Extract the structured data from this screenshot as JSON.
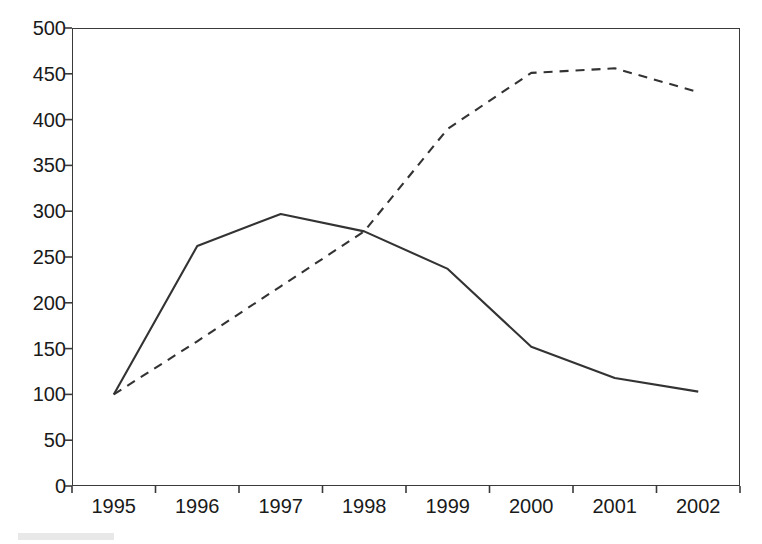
{
  "chart_data": {
    "type": "line",
    "title": "",
    "subtitle": "",
    "xlabel": "",
    "ylabel": "",
    "categories": [
      "1995",
      "1996",
      "1997",
      "1998",
      "1999",
      "2000",
      "2001",
      "2002"
    ],
    "series": [
      {
        "name": "solid-series",
        "style": "solid",
        "color": "#333333",
        "values": [
          100,
          262,
          297,
          278,
          237,
          152,
          118,
          103
        ]
      },
      {
        "name": "dashed-series",
        "style": "dashed",
        "color": "#333333",
        "values": [
          100,
          158,
          218,
          278,
          390,
          451,
          456,
          430
        ]
      }
    ],
    "ylim": [
      0,
      500
    ],
    "y_ticks": [
      "0",
      "50",
      "100",
      "150",
      "200",
      "250",
      "300",
      "350",
      "400",
      "450",
      "500"
    ],
    "y_tick_values": [
      0,
      50,
      100,
      150,
      200,
      250,
      300,
      350,
      400,
      450,
      500
    ],
    "grid": false,
    "legend": false,
    "legend_position": "none",
    "plot_border": true,
    "axis_label_position": "between-ticks"
  }
}
